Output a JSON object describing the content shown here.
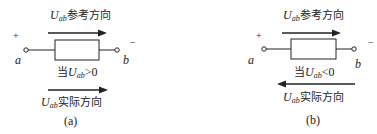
{
  "panels": [
    {
      "id": "a",
      "ref_label_var": "U",
      "ref_label_sub": "ab",
      "ref_label_text": "参考方向",
      "plus": "+",
      "minus": "−",
      "node_a": "a",
      "node_b": "b",
      "cond_prefix": "当",
      "cond_var": "U",
      "cond_sub": "ab",
      "cond_rel": ">0",
      "actual_var": "U",
      "actual_sub": "ab",
      "actual_text": "实际方向",
      "actual_arrow_direction": "right",
      "caption": "(a)"
    },
    {
      "id": "b",
      "ref_label_var": "U",
      "ref_label_sub": "ab",
      "ref_label_text": "参考方向",
      "plus": "+",
      "minus": "−",
      "node_a": "a",
      "node_b": "b",
      "cond_prefix": "当",
      "cond_var": "U",
      "cond_sub": "ab",
      "cond_rel": "<0",
      "actual_var": "U",
      "actual_sub": "ab",
      "actual_text": "实际方向",
      "actual_arrow_direction": "left",
      "caption": "(b)"
    }
  ]
}
